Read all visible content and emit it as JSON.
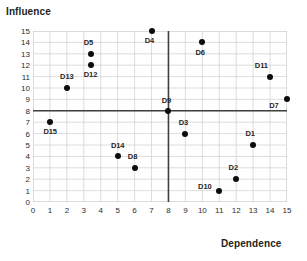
{
  "chart_data": {
    "type": "scatter",
    "title": "",
    "xlabel": "Dependence",
    "ylabel": "Influence",
    "xlim": [
      0,
      15
    ],
    "ylim": [
      0,
      15
    ],
    "xticks": [
      "0",
      "1",
      "2",
      "3",
      "4",
      "5",
      "6",
      "7",
      "8",
      "9",
      "10",
      "11",
      "12",
      "13",
      "14",
      "15"
    ],
    "yticks": [
      "0",
      "1",
      "2",
      "3",
      "4",
      "5",
      "6",
      "7",
      "8",
      "9",
      "10",
      "11",
      "12",
      "13",
      "14",
      "15"
    ],
    "grid": true,
    "legend": "none",
    "crosshair": {
      "x": 8,
      "y": 8,
      "color": "#404040"
    },
    "point_color": "#0d0d0d",
    "points": [
      {
        "label": "D1",
        "x": 13,
        "y": 5,
        "lx": 12.55,
        "ly": 5.95
      },
      {
        "label": "D2",
        "x": 12,
        "y": 2,
        "lx": 11.55,
        "ly": 2.95
      },
      {
        "label": "D3",
        "x": 9,
        "y": 6,
        "lx": 8.6,
        "ly": 6.95
      },
      {
        "label": "D4",
        "x": 7,
        "y": 15,
        "lx": 6.6,
        "ly": 14.1
      },
      {
        "label": "D5",
        "x": 3.4,
        "y": 13,
        "lx": 3.0,
        "ly": 13.95
      },
      {
        "label": "D6",
        "x": 10,
        "y": 14,
        "lx": 9.6,
        "ly": 13.1
      },
      {
        "label": "D7",
        "x": 15,
        "y": 9,
        "lx": 13.95,
        "ly": 8.45
      },
      {
        "label": "D8",
        "x": 6,
        "y": 3,
        "lx": 5.6,
        "ly": 3.95
      },
      {
        "label": "D9",
        "x": 8,
        "y": 8,
        "lx": 7.6,
        "ly": 8.9
      },
      {
        "label": "D10",
        "x": 11,
        "y": 1,
        "lx": 9.75,
        "ly": 1.3
      },
      {
        "label": "D11",
        "x": 14,
        "y": 11,
        "lx": 13.1,
        "ly": 11.95
      },
      {
        "label": "D12",
        "x": 3.4,
        "y": 12,
        "lx": 3.0,
        "ly": 11.1
      },
      {
        "label": "D13",
        "x": 2,
        "y": 10,
        "lx": 1.6,
        "ly": 10.95
      },
      {
        "label": "D14",
        "x": 5,
        "y": 4,
        "lx": 4.6,
        "ly": 4.95
      },
      {
        "label": "D15",
        "x": 1,
        "y": 7,
        "lx": 0.62,
        "ly": 6.1
      }
    ]
  }
}
